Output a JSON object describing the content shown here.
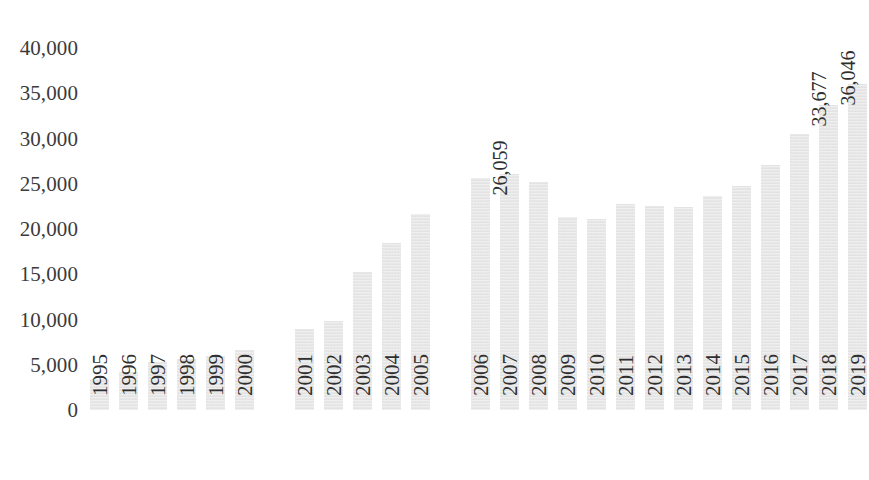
{
  "chart_data": {
    "type": "bar",
    "title": "",
    "subtitle": "",
    "xlabel": "",
    "ylabel": "",
    "ylim": [
      0,
      40000
    ],
    "ytick_step": 5000,
    "grid": false,
    "legend": null,
    "bar_color": "#e9e9e9",
    "y_ticks": [
      "40,000",
      "35,000",
      "30,000",
      "25,000",
      "20,000",
      "15,000",
      "10,000",
      "5,000",
      "0"
    ],
    "y_tick_values": [
      40000,
      35000,
      30000,
      25000,
      20000,
      15000,
      10000,
      5000,
      0
    ],
    "categories": [
      "1995",
      "1996",
      "1997",
      "1998",
      "1999",
      "2000",
      "2001",
      "2002",
      "2003",
      "2004",
      "2005",
      "2006",
      "2007",
      "2008",
      "2009",
      "2010",
      "2011",
      "2012",
      "2013",
      "2014",
      "2015",
      "2016",
      "2017",
      "2018",
      "2019"
    ],
    "values": [
      3400,
      4200,
      5300,
      5600,
      6000,
      6600,
      8900,
      9800,
      15300,
      18400,
      21700,
      25600,
      26059,
      25200,
      21300,
      21100,
      22800,
      22500,
      22400,
      23600,
      24800,
      27100,
      30500,
      33677,
      36046
    ],
    "groups": [
      {
        "name": "group-1",
        "categories": [
          "1995",
          "1996",
          "1997",
          "1998",
          "1999",
          "2000"
        ]
      },
      {
        "name": "group-2",
        "categories": [
          "2001",
          "2002",
          "2003",
          "2004",
          "2005"
        ]
      },
      {
        "name": "group-3",
        "categories": [
          "2006",
          "2007",
          "2008",
          "2009",
          "2010",
          "2011",
          "2012",
          "2013",
          "2014",
          "2015",
          "2016",
          "2017",
          "2018",
          "2019"
        ]
      }
    ],
    "data_labels": [
      {
        "category": "2007",
        "text": "26,059"
      },
      {
        "category": "2018",
        "text": "33,677"
      },
      {
        "category": "2019",
        "text": "36,046"
      }
    ]
  }
}
